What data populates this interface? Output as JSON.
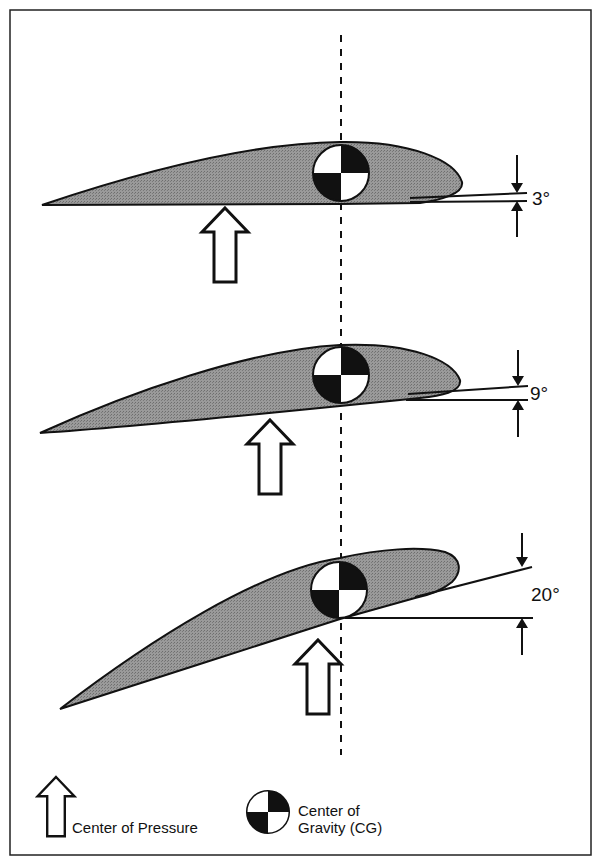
{
  "diagram": {
    "colors": {
      "airfoil_fill": "#8f8f8f",
      "stroke": "#111111",
      "background": "#ffffff"
    },
    "panels": [
      {
        "angle_label": "3°"
      },
      {
        "angle_label": "9°"
      },
      {
        "angle_label": "20°"
      }
    ],
    "legend": {
      "center_of_pressure": "Center of Pressure",
      "center_of_gravity_line1": "Center of",
      "center_of_gravity_line2": "Gravity (CG)"
    }
  }
}
